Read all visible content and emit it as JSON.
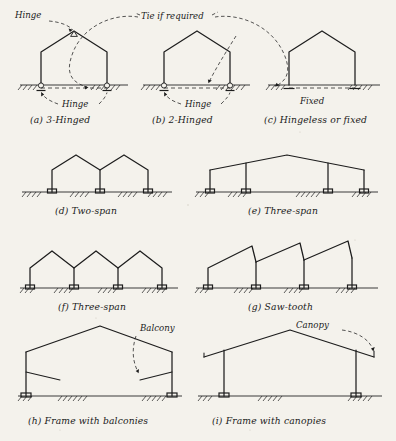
{
  "figure": {
    "background_color": "#f4f2ec",
    "ink_color": "#1d1d1d"
  },
  "annotations": {
    "hinge_top": "Hinge",
    "tie_if_required": "Tie if required",
    "hinge_bottom_a": "Hinge",
    "hinge_bottom_b": "Hinge",
    "fixed": "Fixed",
    "balcony": "Balcony",
    "canopy": "Canopy"
  },
  "diagrams": [
    {
      "id": "a",
      "caption": "(a) 3-Hinged",
      "row": 1,
      "col": 1
    },
    {
      "id": "b",
      "caption": "(b) 2-Hinged",
      "row": 1,
      "col": 2
    },
    {
      "id": "c",
      "caption": "(c) Hingeless or fixed",
      "row": 1,
      "col": 3
    },
    {
      "id": "d",
      "caption": "(d) Two-span",
      "row": 2,
      "col": 1
    },
    {
      "id": "e",
      "caption": "(e) Three-span",
      "row": 2,
      "col": 2
    },
    {
      "id": "f",
      "caption": "(f) Three-span",
      "row": 3,
      "col": 1
    },
    {
      "id": "g",
      "caption": "(g) Saw-tooth",
      "row": 3,
      "col": 2
    },
    {
      "id": "h",
      "caption": "(h) Frame with balconies",
      "row": 4,
      "col": 1
    },
    {
      "id": "i",
      "caption": "(i) Frame with canopies",
      "row": 4,
      "col": 2
    }
  ]
}
